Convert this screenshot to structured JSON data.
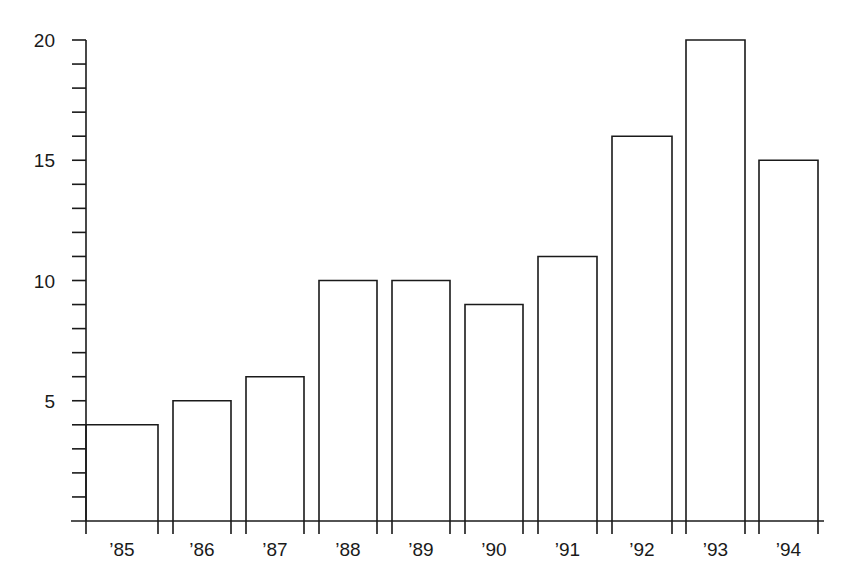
{
  "chart_data": {
    "type": "bar",
    "title": "",
    "xlabel": "",
    "ylabel": "",
    "categories": [
      "'85",
      "'86",
      "'87",
      "'88",
      "'89",
      "'90",
      "'91",
      "'92",
      "'93",
      "'94"
    ],
    "values": [
      4,
      5,
      6,
      10,
      10,
      9,
      11,
      16,
      20,
      15
    ],
    "ylim": [
      0,
      20
    ],
    "y_major_ticks": [
      5,
      10,
      15,
      20
    ],
    "y_minor_tick_step": 1,
    "grid": false,
    "legend": null,
    "bar_fill": "#ffffff",
    "bar_stroke": "#1a1a1a"
  },
  "layout": {
    "axis_x0": 86,
    "baseline_y": 521,
    "px_per_unit": 24.05,
    "x_axis_start": 71,
    "x_axis_end": 824,
    "bars": [
      {
        "x": 86,
        "w": 72
      },
      {
        "x": 173,
        "w": 58
      },
      {
        "x": 246,
        "w": 58
      },
      {
        "x": 319,
        "w": 58
      },
      {
        "x": 392,
        "w": 58
      },
      {
        "x": 465,
        "w": 58
      },
      {
        "x": 538,
        "w": 59
      },
      {
        "x": 612,
        "w": 60
      },
      {
        "x": 686,
        "w": 59
      },
      {
        "x": 759,
        "w": 59
      }
    ]
  }
}
